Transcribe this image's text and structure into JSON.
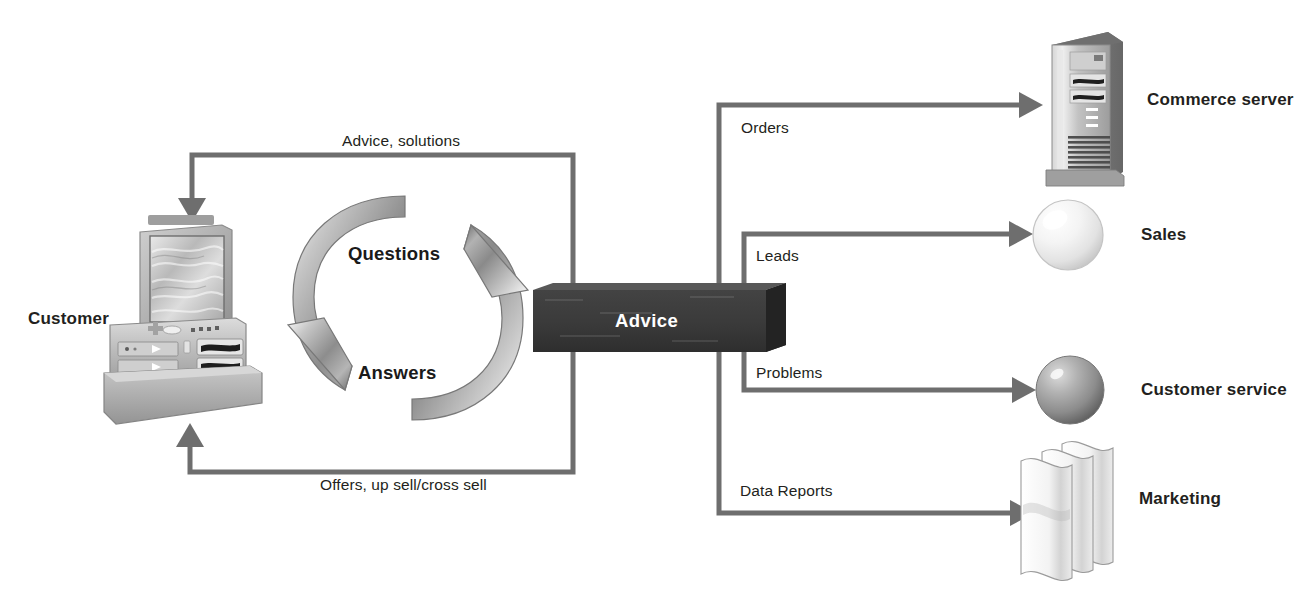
{
  "diagram": {
    "colors": {
      "connector": "#6e6e6e",
      "box_front": "#3a3a3a",
      "box_top": "#585858",
      "box_side": "#2b2b2b",
      "box_text": "#ffffff",
      "text": "#231f20",
      "arrow_cycle": "#8a8a8a",
      "sphere_sales": "#f1f1f1",
      "sphere_service": "#9a9a9a",
      "background": "#ffffff"
    },
    "center_box": {
      "label": "Advice"
    },
    "actor": {
      "label": "Customer",
      "icon": "desktop-computer-icon"
    },
    "cycle": {
      "top_label": "Questions",
      "bottom_label": "Answers",
      "icon": "circular-arrows-icon"
    },
    "feedback_flows": [
      {
        "label": "Advice, solutions",
        "direction": "advice-to-customer"
      },
      {
        "label": "Offers, up sell/cross sell",
        "direction": "advice-to-customer"
      }
    ],
    "outputs": [
      {
        "flow_label": "Orders",
        "node_label": "Commerce server",
        "icon": "server-tower-icon"
      },
      {
        "flow_label": "Leads",
        "node_label": "Sales",
        "icon": "light-sphere-icon"
      },
      {
        "flow_label": "Problems",
        "node_label": "Customer service",
        "icon": "gray-sphere-icon"
      },
      {
        "flow_label": "Data Reports",
        "node_label": "Marketing",
        "icon": "document-stack-icon"
      }
    ]
  }
}
